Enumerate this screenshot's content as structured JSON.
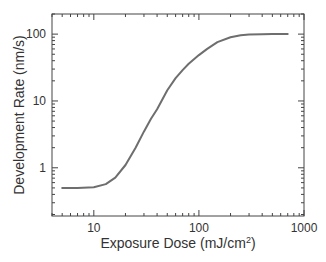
{
  "chart_data": {
    "type": "line",
    "title": "",
    "xlabel": "Exposure Dose (mJ/cm²)",
    "xlabel_base": "Exposure Dose (mJ/cm",
    "xlabel_sup": "2",
    "xlabel_end": ")",
    "ylabel": "Development Rate (nm/s)",
    "xscale": "log",
    "yscale": "log",
    "xlim": [
      4,
      1000
    ],
    "ylim": [
      0.19,
      200
    ],
    "x_ticks": [
      10,
      100,
      1000
    ],
    "x_tick_labels": [
      "10",
      "100",
      "1000"
    ],
    "y_ticks": [
      1,
      10,
      100
    ],
    "y_tick_labels": [
      "1",
      "10",
      "100"
    ],
    "grid": false,
    "legend": null,
    "line_color": "#6e6e6e",
    "series": [
      {
        "name": "Development Rate",
        "x": [
          5,
          7,
          10,
          13,
          16,
          20,
          25,
          30,
          35,
          40,
          50,
          60,
          70,
          80,
          100,
          120,
          150,
          200,
          250,
          300,
          400,
          500,
          700
        ],
        "y": [
          0.5,
          0.5,
          0.51,
          0.57,
          0.71,
          1.1,
          2.0,
          3.5,
          5.4,
          7.5,
          14.5,
          22,
          29,
          36,
          48.5,
          60,
          76,
          90,
          96,
          98.5,
          99.7,
          100,
          100
        ]
      }
    ]
  }
}
